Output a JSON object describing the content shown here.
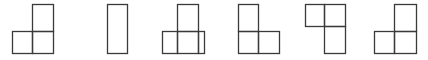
{
  "diagram": {
    "stroke_color": "#3a3a3a",
    "background": "#ffffff",
    "figures": [
      {
        "id": "figure-1",
        "label": "L-shape: one square on top-right, two squares on bottom",
        "cells": [
          {
            "x": 32,
            "y": 4,
            "w": 21,
            "h": 27
          },
          {
            "x": 12,
            "y": 31,
            "w": 20,
            "h": 22
          },
          {
            "x": 32,
            "y": 31,
            "w": 21,
            "h": 22
          }
        ]
      },
      {
        "id": "figure-2",
        "label": "Single tall rectangle",
        "cells": [
          {
            "x": 107,
            "y": 4,
            "w": 20,
            "h": 49
          }
        ]
      },
      {
        "id": "figure-3",
        "label": "Square on top, wide rectangle below with inner dividers",
        "cells": [
          {
            "x": 177,
            "y": 4,
            "w": 21,
            "h": 27
          },
          {
            "x": 162,
            "y": 31,
            "w": 15,
            "h": 22
          },
          {
            "x": 177,
            "y": 31,
            "w": 21,
            "h": 22
          },
          {
            "x": 198,
            "y": 31,
            "w": 6,
            "h": 22
          }
        ]
      },
      {
        "id": "figure-4",
        "label": "L-shape: one square on top-left, two squares on bottom",
        "cells": [
          {
            "x": 238,
            "y": 4,
            "w": 20,
            "h": 27
          },
          {
            "x": 238,
            "y": 31,
            "w": 20,
            "h": 22
          },
          {
            "x": 258,
            "y": 31,
            "w": 21,
            "h": 22
          }
        ]
      },
      {
        "id": "figure-5",
        "label": "Two squares on top, one square below on the right",
        "cells": [
          {
            "x": 305,
            "y": 4,
            "w": 19,
            "h": 22
          },
          {
            "x": 324,
            "y": 4,
            "w": 21,
            "h": 22
          },
          {
            "x": 324,
            "y": 26,
            "w": 21,
            "h": 27
          }
        ]
      },
      {
        "id": "figure-6",
        "label": "L-shape: one square on top-right, two squares on bottom",
        "cells": [
          {
            "x": 394,
            "y": 4,
            "w": 22,
            "h": 27
          },
          {
            "x": 374,
            "y": 31,
            "w": 20,
            "h": 22
          },
          {
            "x": 394,
            "y": 31,
            "w": 22,
            "h": 22
          }
        ]
      }
    ]
  }
}
